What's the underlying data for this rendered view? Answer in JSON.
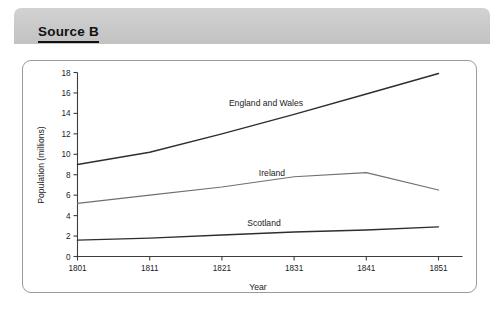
{
  "header": {
    "source_label": "Source B"
  },
  "chart_data": {
    "type": "line",
    "title": "",
    "xlabel": "Year",
    "ylabel": "Population (millions)",
    "x": [
      1801,
      1811,
      1821,
      1831,
      1841,
      1851
    ],
    "xtick_labels": [
      "1801",
      "1811",
      "1821",
      "1831",
      "1841",
      "1851"
    ],
    "ytick_labels": [
      "0",
      "2",
      "4",
      "6",
      "8",
      "10",
      "12",
      "14",
      "16",
      "18"
    ],
    "yticks": [
      0,
      2,
      4,
      6,
      8,
      10,
      12,
      14,
      16,
      18
    ],
    "ylim": [
      0,
      18
    ],
    "xlim": [
      1801,
      1851
    ],
    "grid": false,
    "legend_position": "inline-annotations",
    "series": [
      {
        "name": "England and Wales",
        "values": [
          9.0,
          10.2,
          12.0,
          13.9,
          15.9,
          17.9
        ],
        "label_text": "England and Wales"
      },
      {
        "name": "Ireland",
        "values": [
          5.2,
          6.0,
          6.8,
          7.8,
          8.2,
          6.5
        ],
        "label_text": "Ireland"
      },
      {
        "name": "Scotland",
        "values": [
          1.6,
          1.8,
          2.1,
          2.4,
          2.6,
          2.9
        ],
        "label_text": "Scotland"
      }
    ]
  }
}
